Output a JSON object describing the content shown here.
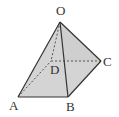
{
  "diagram": {
    "type": "square pyramid",
    "vertices": {
      "O": {
        "label": "O",
        "x": 60,
        "y": 22,
        "lx": 56,
        "ly": 15
      },
      "A": {
        "label": "A",
        "x": 18,
        "y": 97,
        "lx": 9,
        "ly": 110
      },
      "B": {
        "label": "B",
        "x": 68,
        "y": 97,
        "lx": 66,
        "ly": 111
      },
      "C": {
        "label": "C",
        "x": 101,
        "y": 61,
        "lx": 103,
        "ly": 66
      },
      "D": {
        "label": "D",
        "x": 51,
        "y": 61,
        "lx": 50,
        "ly": 74
      }
    },
    "solid_edges": [
      "OA",
      "OB",
      "OC",
      "AB",
      "BC"
    ],
    "hidden_edges": [
      "OD",
      "AD",
      "DC"
    ],
    "fill_color": "#d4d4d4",
    "edge_color": "#333333"
  }
}
